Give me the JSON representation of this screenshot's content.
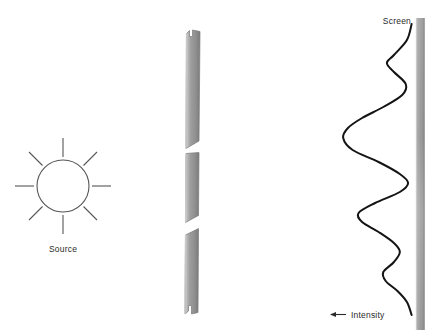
{
  "figure": {
    "type": "double-slit-interference-diagram",
    "background_color": "#ffffff",
    "width": 434,
    "height": 335,
    "clipped_top_caption": "",
    "labels": {
      "source": "Source",
      "screen": "Screen",
      "intensity": "Intensity"
    },
    "colors": {
      "line": "#4a4a4a",
      "curve": "#1a1a1a",
      "barrier_light": "#d9d9d9",
      "barrier_mid": "#9a9a9a",
      "barrier_dark": "#7d7d7d",
      "screen_light": "#b6b6b6",
      "screen_mid": "#9d9d9d",
      "screen_dark": "#8a8a8a",
      "text": "#2b2b2b"
    }
  },
  "source": {
    "name": "Source",
    "center_x": 63,
    "center_y": 186,
    "radius": 26,
    "ray_count": 8,
    "ray_inner": 29,
    "ray_outer": 48,
    "label_x": 63,
    "label_y": 252
  },
  "barrier": {
    "name": "Barrier with two slits",
    "segment_count": 3,
    "slit_count": 2,
    "segments": [
      {
        "id": "barrier-segment-top",
        "top": 30,
        "bottom": 148
      },
      {
        "id": "barrier-segment-middle",
        "top": 152,
        "bottom": 222
      },
      {
        "id": "barrier-segment-bottom",
        "top": 228,
        "bottom": 312
      }
    ],
    "slits": [
      {
        "id": "slit-upper",
        "top": 148,
        "bottom": 152
      },
      {
        "id": "slit-lower",
        "top": 222,
        "bottom": 228
      }
    ]
  },
  "screen": {
    "name": "Screen",
    "label": "Screen",
    "label_x": 399,
    "label_y": 23,
    "bar_x": 416,
    "bar_width": 8,
    "bar_top": 18,
    "bar_bottom": 330
  },
  "intensity": {
    "name": "Intensity curve",
    "label": "Intensity",
    "label_x": 355,
    "label_y": 317,
    "arrow_from_x": 345,
    "arrow_to_x": 330,
    "arrow_y": 314,
    "baseline_x": 414,
    "description": "Interference fringe intensity profile plotted horizontally against the screen"
  },
  "chart_data": {
    "type": "line",
    "title": "",
    "xlabel": "Intensity",
    "ylabel": "",
    "orientation": "horizontal-intensity-vertical-position",
    "series": [
      {
        "name": "Intensity",
        "points": [
          {
            "y": 24,
            "intensity": 0.02
          },
          {
            "y": 40,
            "intensity": 0.06
          },
          {
            "y": 55,
            "intensity": 0.17
          },
          {
            "y": 63,
            "intensity": 0.23
          },
          {
            "y": 72,
            "intensity": 0.17
          },
          {
            "y": 84,
            "intensity": 0.07
          },
          {
            "y": 95,
            "intensity": 0.1
          },
          {
            "y": 107,
            "intensity": 0.26
          },
          {
            "y": 118,
            "intensity": 0.44
          },
          {
            "y": 128,
            "intensity": 0.56
          },
          {
            "y": 138,
            "intensity": 0.6
          },
          {
            "y": 150,
            "intensity": 0.52
          },
          {
            "y": 162,
            "intensity": 0.3
          },
          {
            "y": 174,
            "intensity": 0.12
          },
          {
            "y": 183,
            "intensity": 0.05
          },
          {
            "y": 192,
            "intensity": 0.12
          },
          {
            "y": 203,
            "intensity": 0.33
          },
          {
            "y": 213,
            "intensity": 0.47
          },
          {
            "y": 222,
            "intensity": 0.44
          },
          {
            "y": 232,
            "intensity": 0.3
          },
          {
            "y": 243,
            "intensity": 0.17
          },
          {
            "y": 252,
            "intensity": 0.12
          },
          {
            "y": 262,
            "intensity": 0.17
          },
          {
            "y": 272,
            "intensity": 0.26
          },
          {
            "y": 281,
            "intensity": 0.24
          },
          {
            "y": 291,
            "intensity": 0.14
          },
          {
            "y": 302,
            "intensity": 0.06
          },
          {
            "y": 315,
            "intensity": 0.02
          }
        ]
      }
    ],
    "grid": false,
    "legend": false
  }
}
